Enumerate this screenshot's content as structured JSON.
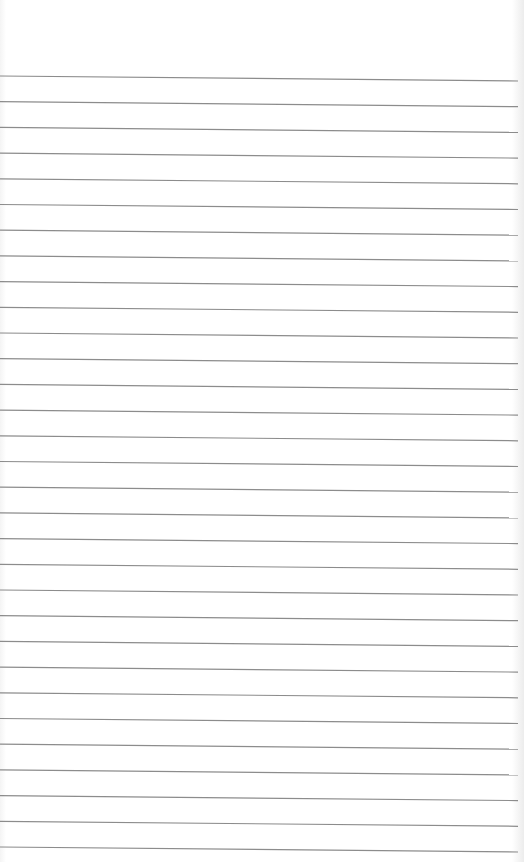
{
  "page": {
    "type": "blank-lined-paper",
    "background_color": "#ffffff",
    "line_color": "#8c8c8c",
    "line_count": 31,
    "first_line_y_left": 76,
    "first_line_y_right": 81,
    "line_spacing": 25.7,
    "line_width": 1.2
  }
}
